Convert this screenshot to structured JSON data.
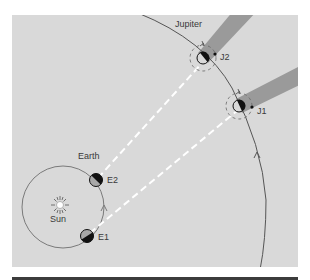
{
  "figure": {
    "type": "orbital-diagram",
    "colors": {
      "panel_background": "#d9d9d9",
      "orbit_line": "#6e6e6e",
      "jupiter_orbit_line": "#555555",
      "sight_line": "#ffffff",
      "shadow_band": "#9a9a9a",
      "planet_dark": "#111111",
      "planet_light": "#a8a8a8",
      "bottom_rule": "#3c3c3c"
    }
  },
  "labels": {
    "jupiter": "Jupiter",
    "earth": "Earth",
    "sun": "Sun",
    "e1": "E1",
    "e2": "E2",
    "j1": "J1",
    "j2": "J2"
  },
  "positions": {
    "sun": {
      "x": 60,
      "y": 205
    },
    "earth_orbit": {
      "cx": 63,
      "cy": 207,
      "r": 41
    },
    "e1": {
      "x": 87,
      "y": 236
    },
    "e2": {
      "x": 96,
      "y": 180
    },
    "j1": {
      "x": 239,
      "y": 106
    },
    "j2": {
      "x": 203,
      "y": 58
    }
  },
  "sight_lines": [
    {
      "from": "E1",
      "to": "J1"
    },
    {
      "from": "E2",
      "to": "J2"
    }
  ]
}
